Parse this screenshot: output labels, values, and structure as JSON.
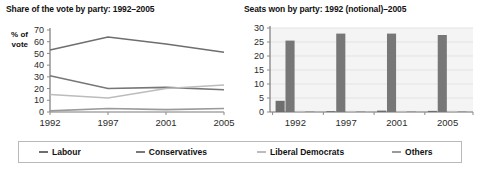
{
  "panels": {
    "line": {
      "title": "Share of the vote by party: 1992–2005",
      "axis_label_line1": "% of",
      "axis_label_line2": "vote",
      "yticks": [
        "70",
        "60",
        "50",
        "40",
        "30",
        "20",
        "10",
        "0"
      ],
      "xticks": [
        "1992",
        "1997",
        "2001",
        "2005"
      ]
    },
    "bar": {
      "title": "Seats won by party: 1992 (notional)–2005",
      "yticks": [
        "30",
        "25",
        "20",
        "15",
        "10",
        "5",
        "0"
      ],
      "xticks": [
        "1992",
        "1997",
        "2001",
        "2005"
      ]
    }
  },
  "legend": {
    "position": "bottom",
    "items": [
      {
        "label": "Labour",
        "color": "#6e6e6e"
      },
      {
        "label": "Conservatives",
        "color": "#777777"
      },
      {
        "label": "Liberal Democrats",
        "color": "#bcbcbc"
      },
      {
        "label": "Others",
        "color": "#9a9a9a"
      }
    ]
  },
  "chart_data": [
    {
      "type": "line",
      "title": "Share of the vote by party: 1992–2005",
      "xlabel": "",
      "ylabel": "% of vote",
      "categories": [
        "1992",
        "1997",
        "2001",
        "2005"
      ],
      "ylim": [
        0,
        70
      ],
      "ytick_step": 10,
      "grid": false,
      "legend": "bottom",
      "series": [
        {
          "name": "Labour",
          "color": "#6e6e6e",
          "values": [
            53,
            64,
            58,
            51
          ]
        },
        {
          "name": "Conservatives",
          "color": "#777777",
          "values": [
            31,
            20,
            21,
            19
          ]
        },
        {
          "name": "Liberal Democrats",
          "color": "#bcbcbc",
          "values": [
            15,
            12,
            20,
            23
          ]
        },
        {
          "name": "Others",
          "color": "#9a9a9a",
          "values": [
            1,
            3,
            2,
            3
          ]
        }
      ]
    },
    {
      "type": "bar",
      "title": "Seats won by party: 1992 (notional)–2005",
      "xlabel": "",
      "ylabel": "",
      "categories": [
        "1992",
        "1997",
        "2001",
        "2005"
      ],
      "ylim": [
        0,
        30
      ],
      "ytick_step": 5,
      "grid": true,
      "legend": "bottom",
      "series": [
        {
          "name": "Labour",
          "color": "#6e6e6e",
          "values": [
            4,
            0.3,
            0.5,
            0.4
          ]
        },
        {
          "name": "Conservatives",
          "color": "#777777",
          "values": [
            25.5,
            28,
            28,
            27.5
          ]
        },
        {
          "name": "Liberal Democrats",
          "color": "#bcbcbc",
          "values": [
            0.4,
            0.4,
            0.4,
            0.4
          ]
        },
        {
          "name": "Others",
          "color": "#9a9a9a",
          "values": [
            0.3,
            0.3,
            0.3,
            0.3
          ]
        }
      ]
    }
  ]
}
